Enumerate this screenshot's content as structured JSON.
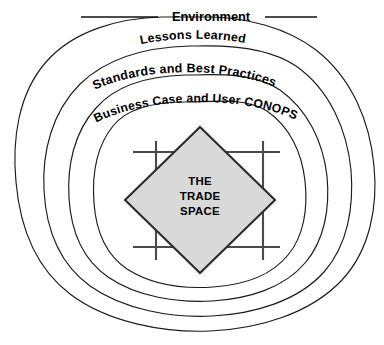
{
  "diagram": {
    "title": "The Trade Space",
    "type": "nested-rings-venn",
    "background_color": "#ffffff",
    "line_color": "#1a1a1a",
    "rings": [
      {
        "index": 0,
        "label": "Environment",
        "label_placement": "top-center-gap",
        "label_style": "horizontal-with-flanking-rules"
      },
      {
        "index": 1,
        "label": "Lessons Learned",
        "label_placement": "top-arc",
        "label_style": "curved"
      },
      {
        "index": 2,
        "label": "Standards and Best Practices",
        "label_placement": "top-arc",
        "label_style": "curved"
      },
      {
        "index": 3,
        "label": "Business Case and User CONOPS",
        "label_placement": "top-arc",
        "label_style": "curved"
      }
    ],
    "center": {
      "shape": "diamond",
      "fill_color": "#d9d9d9",
      "stroke_color": "#2b2b2b",
      "lines": [
        "THE",
        "TRADE",
        "SPACE"
      ],
      "line1": "THE",
      "line2": "TRADE",
      "line3": "SPACE"
    },
    "grid": {
      "name": "crosshair-grid",
      "vertical_lines": 2,
      "horizontal_lines": 2,
      "stroke_color": "#4a4a4a"
    }
  }
}
